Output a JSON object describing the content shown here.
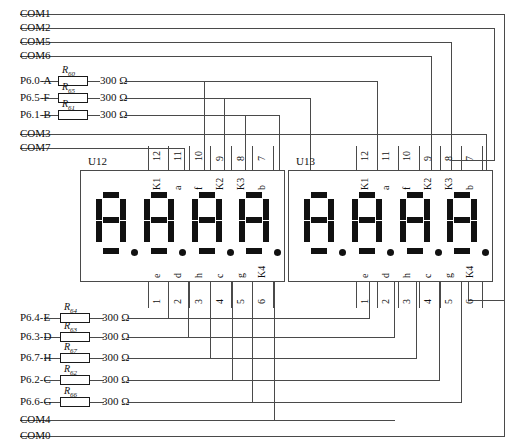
{
  "diagram": {
    "line_color": "#4a4a4a",
    "segment_color": "#111111"
  },
  "left_nets": [
    {
      "id": "com1",
      "label": "COM1",
      "y": 8,
      "kind": "plain"
    },
    {
      "id": "com2",
      "label": "COM2",
      "y": 22,
      "kind": "plain"
    },
    {
      "id": "com5",
      "label": "COM5",
      "y": 36,
      "kind": "plain"
    },
    {
      "id": "com6",
      "label": "COM6",
      "y": 50,
      "kind": "plain"
    },
    {
      "id": "p60a",
      "label": "P6.0-A",
      "y": 75,
      "kind": "resistor",
      "ref": "R",
      "sub": "60",
      "value": "300 Ω"
    },
    {
      "id": "p65f",
      "label": "P6.5-F",
      "y": 92,
      "kind": "resistor",
      "ref": "R",
      "sub": "65",
      "value": "300 Ω"
    },
    {
      "id": "p61b",
      "label": "P6.1-B",
      "y": 109,
      "kind": "resistor",
      "ref": "R",
      "sub": "61",
      "value": "300 Ω"
    },
    {
      "id": "com3",
      "label": "COM3",
      "y": 128,
      "kind": "plain"
    },
    {
      "id": "com7",
      "label": "COM7",
      "y": 142,
      "kind": "plain"
    },
    {
      "id": "p64e",
      "label": "P6.4-E",
      "y": 312,
      "kind": "resistor",
      "ref": "R",
      "sub": "64",
      "value": "300 Ω"
    },
    {
      "id": "p63d",
      "label": "P6.3-D",
      "y": 331,
      "kind": "resistor",
      "ref": "R",
      "sub": "63",
      "value": "300 Ω"
    },
    {
      "id": "p67h",
      "label": "P6.7-H",
      "y": 352,
      "kind": "resistor",
      "ref": "R",
      "sub": "67",
      "value": "300 Ω"
    },
    {
      "id": "p62c",
      "label": "P6.2-C",
      "y": 374,
      "kind": "resistor",
      "ref": "R",
      "sub": "62",
      "value": "300 Ω"
    },
    {
      "id": "p66g",
      "label": "P6.6-G",
      "y": 396,
      "kind": "resistor",
      "ref": "R",
      "sub": "66",
      "value": "300 Ω"
    },
    {
      "id": "com4",
      "label": "COM4",
      "y": 414,
      "kind": "plain"
    },
    {
      "id": "com0",
      "label": "COM0",
      "y": 430,
      "kind": "plain"
    }
  ],
  "modules": [
    {
      "id": "u12",
      "name": "U12",
      "x": 80,
      "y": 170,
      "width": 205,
      "height": 112,
      "digits": 4,
      "top_pins": [
        {
          "num": "12",
          "sig": "K1"
        },
        {
          "num": "11",
          "sig": "a"
        },
        {
          "num": "10",
          "sig": "f"
        },
        {
          "num": "9",
          "sig": "K2"
        },
        {
          "num": "8",
          "sig": "K3"
        },
        {
          "num": "7",
          "sig": "b"
        }
      ],
      "bottom_pins": [
        {
          "num": "1",
          "sig": "e"
        },
        {
          "num": "2",
          "sig": "d"
        },
        {
          "num": "3",
          "sig": "h"
        },
        {
          "num": "4",
          "sig": "c"
        },
        {
          "num": "5",
          "sig": "g"
        },
        {
          "num": "6",
          "sig": "K4"
        }
      ]
    },
    {
      "id": "u13",
      "name": "U13",
      "x": 288,
      "y": 170,
      "width": 205,
      "height": 112,
      "digits": 4,
      "top_pins": [
        {
          "num": "12",
          "sig": "K1"
        },
        {
          "num": "11",
          "sig": "a"
        },
        {
          "num": "10",
          "sig": "f"
        },
        {
          "num": "9",
          "sig": "K2"
        },
        {
          "num": "8",
          "sig": "K3"
        },
        {
          "num": "7",
          "sig": "b"
        }
      ],
      "bottom_pins": [
        {
          "num": "1",
          "sig": "e"
        },
        {
          "num": "2",
          "sig": "d"
        },
        {
          "num": "3",
          "sig": "h"
        },
        {
          "num": "4",
          "sig": "c"
        },
        {
          "num": "5",
          "sig": "g"
        },
        {
          "num": "6",
          "sig": "K4"
        }
      ]
    }
  ]
}
